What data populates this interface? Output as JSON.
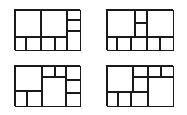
{
  "page": {
    "background_color": "#ffffff",
    "line_color": "#1a1a1a",
    "width": 187,
    "height": 115,
    "figure_count": 4,
    "layout": "2x2 grid of rectangle partition diagrams"
  },
  "figures": [
    {
      "id": "figure-top-left",
      "name": "Dissection A",
      "position": {
        "left": 14,
        "top": 9,
        "width": 66,
        "height": 41
      },
      "cell_count": 9,
      "cells": [
        {
          "name": "cell-a1",
          "left": 0,
          "top": 0,
          "width": 26,
          "height": 27
        },
        {
          "name": "cell-a2",
          "left": 26,
          "top": 0,
          "width": 26,
          "height": 27
        },
        {
          "name": "cell-a3",
          "left": 52,
          "top": 0,
          "width": 14,
          "height": 10
        },
        {
          "name": "cell-a4",
          "left": 52,
          "top": 10,
          "width": 14,
          "height": 11
        },
        {
          "name": "cell-a5",
          "left": 52,
          "top": 21,
          "width": 14,
          "height": 20
        },
        {
          "name": "cell-a6",
          "left": 0,
          "top": 27,
          "width": 11,
          "height": 14
        },
        {
          "name": "cell-a7",
          "left": 11,
          "top": 27,
          "width": 15,
          "height": 14
        },
        {
          "name": "cell-a8",
          "left": 26,
          "top": 27,
          "width": 14,
          "height": 14
        },
        {
          "name": "cell-a9",
          "left": 40,
          "top": 27,
          "width": 12,
          "height": 14
        }
      ]
    },
    {
      "id": "figure-top-right",
      "name": "Dissection B",
      "position": {
        "left": 106,
        "top": 9,
        "width": 67,
        "height": 41
      },
      "cell_count": 10,
      "cells": [
        {
          "name": "cell-b1",
          "left": 0,
          "top": 0,
          "width": 28,
          "height": 27
        },
        {
          "name": "cell-b2",
          "left": 28,
          "top": 0,
          "width": 12,
          "height": 13
        },
        {
          "name": "cell-b3",
          "left": 28,
          "top": 13,
          "width": 12,
          "height": 14
        },
        {
          "name": "cell-b4",
          "left": 40,
          "top": 0,
          "width": 27,
          "height": 27
        },
        {
          "name": "cell-b5",
          "left": 0,
          "top": 27,
          "width": 10,
          "height": 14
        },
        {
          "name": "cell-b6",
          "left": 10,
          "top": 27,
          "width": 14,
          "height": 14
        },
        {
          "name": "cell-b7",
          "left": 24,
          "top": 27,
          "width": 16,
          "height": 14
        },
        {
          "name": "cell-b8",
          "left": 40,
          "top": 27,
          "width": 13,
          "height": 14
        },
        {
          "name": "cell-b9",
          "left": 53,
          "top": 27,
          "width": 14,
          "height": 14
        }
      ]
    },
    {
      "id": "figure-bottom-left",
      "name": "Dissection C",
      "position": {
        "left": 14,
        "top": 65,
        "width": 66,
        "height": 41
      },
      "cell_count": 9,
      "cells": [
        {
          "name": "cell-c1",
          "left": 0,
          "top": 0,
          "width": 27,
          "height": 25
        },
        {
          "name": "cell-c2",
          "left": 27,
          "top": 0,
          "width": 13,
          "height": 11
        },
        {
          "name": "cell-c3",
          "left": 40,
          "top": 0,
          "width": 11,
          "height": 11
        },
        {
          "name": "cell-c4",
          "left": 51,
          "top": 0,
          "width": 15,
          "height": 14
        },
        {
          "name": "cell-c5",
          "left": 51,
          "top": 14,
          "width": 15,
          "height": 13
        },
        {
          "name": "cell-c6",
          "left": 51,
          "top": 27,
          "width": 15,
          "height": 14
        },
        {
          "name": "cell-c7",
          "left": 27,
          "top": 11,
          "width": 24,
          "height": 30
        },
        {
          "name": "cell-c8",
          "left": 0,
          "top": 25,
          "width": 12,
          "height": 16
        },
        {
          "name": "cell-c9",
          "left": 12,
          "top": 25,
          "width": 15,
          "height": 16
        }
      ]
    },
    {
      "id": "figure-bottom-right",
      "name": "Dissection D",
      "position": {
        "left": 106,
        "top": 65,
        "width": 67,
        "height": 41
      },
      "cell_count": 10,
      "cells": [
        {
          "name": "cell-d1",
          "left": 0,
          "top": 0,
          "width": 26,
          "height": 26
        },
        {
          "name": "cell-d2",
          "left": 26,
          "top": 0,
          "width": 15,
          "height": 11
        },
        {
          "name": "cell-d3",
          "left": 41,
          "top": 0,
          "width": 13,
          "height": 11
        },
        {
          "name": "cell-d4",
          "left": 54,
          "top": 0,
          "width": 13,
          "height": 11
        },
        {
          "name": "cell-d5",
          "left": 26,
          "top": 11,
          "width": 15,
          "height": 15
        },
        {
          "name": "cell-d6",
          "left": 41,
          "top": 11,
          "width": 26,
          "height": 30
        },
        {
          "name": "cell-d7",
          "left": 0,
          "top": 26,
          "width": 11,
          "height": 15
        },
        {
          "name": "cell-d8",
          "left": 11,
          "top": 26,
          "width": 13,
          "height": 15
        },
        {
          "name": "cell-d9",
          "left": 24,
          "top": 26,
          "width": 17,
          "height": 15
        }
      ]
    }
  ]
}
